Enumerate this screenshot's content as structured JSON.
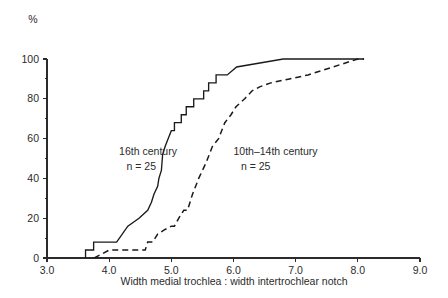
{
  "chart_data": {
    "type": "line",
    "title": "",
    "subtitle": "",
    "xlabel": "Width medial trochlea : width intertrochlear notch",
    "ylabel": "%",
    "y_unit_label": "%",
    "xlim": [
      3.0,
      9.0
    ],
    "ylim": [
      0,
      100
    ],
    "grid": false,
    "legend_position": "inline-annotations",
    "x_ticks": [
      "3.0",
      "4.0",
      "5.0",
      "6.0",
      "7.0",
      "8.0",
      "9.0"
    ],
    "x_tick_values": [
      3.0,
      4.0,
      5.0,
      6.0,
      7.0,
      8.0,
      9.0
    ],
    "y_ticks": [
      "0",
      "20",
      "40",
      "60",
      "80",
      "100"
    ],
    "y_tick_values": [
      0,
      20,
      40,
      60,
      80,
      100
    ],
    "y_minor_tick_values": [
      10,
      30,
      50,
      70,
      90
    ],
    "series": [
      {
        "name": "16th century",
        "style": "solid",
        "n": 25,
        "label": "16th century",
        "n_label": "n = 25",
        "points": [
          [
            3.62,
            0
          ],
          [
            3.62,
            4
          ],
          [
            3.75,
            4
          ],
          [
            3.75,
            8
          ],
          [
            4.12,
            8
          ],
          [
            4.3,
            16
          ],
          [
            4.48,
            20
          ],
          [
            4.62,
            24
          ],
          [
            4.68,
            28
          ],
          [
            4.72,
            32
          ],
          [
            4.78,
            36
          ],
          [
            4.8,
            40
          ],
          [
            4.84,
            44
          ],
          [
            4.86,
            52
          ],
          [
            4.9,
            56
          ],
          [
            4.95,
            60
          ],
          [
            5.0,
            64
          ],
          [
            5.05,
            64
          ],
          [
            5.05,
            68
          ],
          [
            5.16,
            68
          ],
          [
            5.16,
            72
          ],
          [
            5.24,
            72
          ],
          [
            5.24,
            76
          ],
          [
            5.36,
            76
          ],
          [
            5.36,
            80
          ],
          [
            5.52,
            80
          ],
          [
            5.52,
            84
          ],
          [
            5.6,
            84
          ],
          [
            5.6,
            88
          ],
          [
            5.72,
            88
          ],
          [
            5.72,
            92
          ],
          [
            5.9,
            92
          ],
          [
            6.05,
            96
          ],
          [
            6.8,
            100
          ],
          [
            8.1,
            100
          ]
        ]
      },
      {
        "name": "10th-14th century",
        "style": "dashed",
        "n": 25,
        "label": "10th–14th century",
        "n_label": "n = 25",
        "points": [
          [
            3.76,
            0
          ],
          [
            4.0,
            4
          ],
          [
            4.1,
            4
          ],
          [
            4.58,
            4
          ],
          [
            4.62,
            8
          ],
          [
            4.7,
            8
          ],
          [
            4.78,
            12
          ],
          [
            4.88,
            14
          ],
          [
            5.0,
            16
          ],
          [
            5.05,
            16
          ],
          [
            5.12,
            20
          ],
          [
            5.2,
            24
          ],
          [
            5.26,
            24
          ],
          [
            5.34,
            32
          ],
          [
            5.44,
            40
          ],
          [
            5.56,
            48
          ],
          [
            5.66,
            56
          ],
          [
            5.76,
            60
          ],
          [
            5.86,
            68
          ],
          [
            5.96,
            72
          ],
          [
            6.04,
            76
          ],
          [
            6.18,
            80
          ],
          [
            6.3,
            84
          ],
          [
            6.42,
            86
          ],
          [
            6.6,
            88
          ],
          [
            6.9,
            90
          ],
          [
            7.2,
            92
          ],
          [
            7.6,
            96
          ],
          [
            8.0,
            100
          ],
          [
            8.1,
            100
          ]
        ]
      }
    ],
    "annotations": [
      {
        "id": "annot-16th",
        "text": "16th century",
        "x": 4.16,
        "y": 52
      },
      {
        "id": "annot-16th-n",
        "text": "n = 25",
        "x": 4.28,
        "y": 44
      },
      {
        "id": "annot-10th",
        "text": "10th–14th century",
        "x": 6.0,
        "y": 52
      },
      {
        "id": "annot-10th-n",
        "text": "n = 25",
        "x": 6.12,
        "y": 44
      }
    ]
  }
}
